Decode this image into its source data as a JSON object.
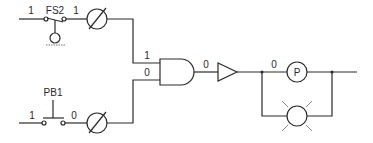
{
  "diagram": {
    "type": "logic-circuit",
    "colors": {
      "line": "#2a2a2a",
      "background": "#ffffff",
      "lamp_rays": "#8a8a8a"
    },
    "float_switch": {
      "label": "FS2",
      "input_state": "1",
      "output_state": "1"
    },
    "push_button": {
      "label": "PB1",
      "input_state": "1",
      "output_state": "0"
    },
    "and_gate": {
      "input_a_state": "1",
      "input_b_state": "0",
      "output_state": "0"
    },
    "pilot_light": {
      "label": "P",
      "input_state": "0"
    },
    "components": [
      "float-switch FS2",
      "gauge (top)",
      "push-button PB1",
      "gauge (bottom)",
      "AND gate",
      "buffer/amplifier",
      "pilot light P",
      "lamp"
    ]
  }
}
